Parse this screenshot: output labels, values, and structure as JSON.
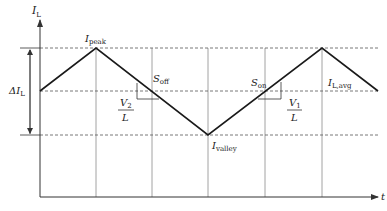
{
  "diagram": {
    "type": "inductor-current-waveform",
    "axes": {
      "y_label": "I",
      "y_label_sub": "L",
      "x_label": "t"
    },
    "levels": {
      "peak": {
        "label": "I",
        "sub": "peak"
      },
      "valley": {
        "label": "I",
        "sub": "valley"
      },
      "average": {
        "label": "I",
        "sub": "L,avg"
      }
    },
    "ripple": {
      "label": "ΔI",
      "sub": "L"
    },
    "slopes": {
      "off": {
        "label": "S",
        "sub": "off",
        "num": "V",
        "num_sub": "2",
        "den": "L"
      },
      "on": {
        "label": "S",
        "sub": "on",
        "num": "V",
        "num_sub": "1",
        "den": "L"
      }
    },
    "colors": {
      "waveform": "#1a1a1a",
      "grid": "#888888",
      "dashed": "#555555",
      "axis": "#333333"
    }
  }
}
